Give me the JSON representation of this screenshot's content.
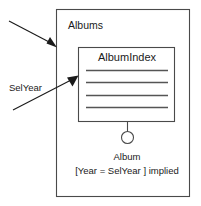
{
  "diagram": {
    "type": "uml-object-diagram",
    "canvas": {
      "width": 201,
      "height": 206,
      "background": "#ffffff"
    },
    "colors": {
      "box_stroke": "#4a4a4a",
      "text": "#1a1a1a",
      "rule_line": "#555555",
      "arrow": "#1a1a1a",
      "background": "#ffffff"
    },
    "outer_container": {
      "label": "Albums",
      "label_position": "top-left-inside",
      "bounds": {
        "x": 56,
        "y": 9,
        "width": 134,
        "height": 188
      }
    },
    "inner_box": {
      "title": "AlbumIndex",
      "bounds": {
        "x": 78,
        "y": 47,
        "width": 97,
        "height": 75
      },
      "rule_lines": {
        "count": 4,
        "x_start": 86,
        "x_end": 168,
        "y_positions": [
          70,
          82,
          95,
          107
        ]
      }
    },
    "connector": {
      "line": {
        "x": 127,
        "y_start": 122,
        "y_end": 131
      },
      "circle": {
        "cx": 127,
        "cy": 137,
        "r": 6
      }
    },
    "captions": {
      "instance_label": "Album",
      "condition_label": "[Year = SelYear ] implied"
    },
    "side_label": {
      "text": "SelYear"
    },
    "arrows": [
      {
        "name": "arrow-to-albums-container",
        "from": {
          "x": 9,
          "y": 21
        },
        "to": {
          "x": 56,
          "y": 47
        }
      },
      {
        "name": "arrow-to-albumindex-box",
        "from": {
          "x": 13,
          "y": 110
        },
        "to": {
          "x": 78,
          "y": 76
        }
      }
    ]
  }
}
